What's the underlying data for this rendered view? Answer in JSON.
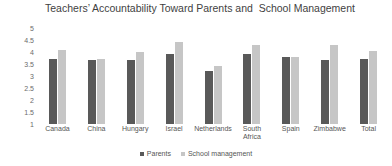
{
  "chart_data": {
    "type": "bar",
    "title": "Teachers’ Accountability Toward Parents and  School Management",
    "xlabel": "",
    "ylabel": "",
    "ylim": [
      1,
      5
    ],
    "ytick_labels": [
      "5",
      "4.5",
      "4",
      "3.5",
      "3",
      "2.5",
      "2",
      "1.5",
      "1"
    ],
    "grid": false,
    "legend_position": "bottom-center",
    "categories": [
      "Canada",
      "China",
      "Hungary",
      "Israel",
      "Netherlands",
      "South\nAfrica",
      "Spain",
      "Zimbabwe",
      "Total"
    ],
    "series": [
      {
        "name": "Parents",
        "color": "#595959",
        "values": [
          3.7,
          3.65,
          3.65,
          3.9,
          3.2,
          3.9,
          3.8,
          3.65,
          3.7
        ]
      },
      {
        "name": "School management",
        "color": "#c6c6c6",
        "values": [
          4.1,
          3.7,
          4.0,
          4.4,
          3.4,
          4.3,
          3.8,
          4.3,
          4.05
        ]
      }
    ]
  },
  "legend": {
    "entries": [
      {
        "label": "Parents",
        "color": "#595959"
      },
      {
        "label": "School management",
        "color": "#c6c6c6"
      }
    ]
  }
}
